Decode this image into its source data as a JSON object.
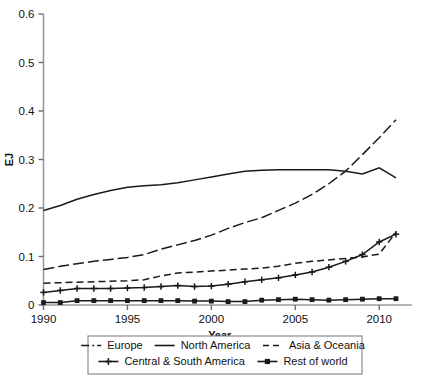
{
  "chart_data": {
    "type": "line",
    "title": "",
    "xlabel": "Year",
    "ylabel": "EJ",
    "xlim": [
      1990,
      2011
    ],
    "ylim": [
      0,
      0.6
    ],
    "xticks": [
      1990,
      1995,
      2000,
      2005,
      2010
    ],
    "yticks": [
      0,
      0.1,
      0.2,
      0.3,
      0.4,
      0.5,
      0.6
    ],
    "ytick_labels": [
      "0",
      "0.1",
      "0.2",
      "0.3",
      "0.4",
      "0.5",
      "0.6"
    ],
    "xtick_labels": [
      "1990",
      "1995",
      "2000",
      "2005",
      "2010"
    ],
    "grid": false,
    "legend_position": "below",
    "x": [
      1990,
      1991,
      1992,
      1993,
      1994,
      1995,
      1996,
      1997,
      1998,
      1999,
      2000,
      2001,
      2002,
      2003,
      2004,
      2005,
      2006,
      2007,
      2008,
      2009,
      2010,
      2011
    ],
    "series": [
      {
        "name": "Europe",
        "style": "dash-dot",
        "marker": "none",
        "color": "#1a1a1a",
        "values": [
          0.073,
          0.08,
          0.085,
          0.09,
          0.094,
          0.098,
          0.104,
          0.115,
          0.124,
          0.133,
          0.144,
          0.158,
          0.17,
          0.18,
          0.195,
          0.21,
          0.228,
          0.25,
          0.276,
          0.31,
          0.345,
          0.382
        ]
      },
      {
        "name": "North America",
        "style": "solid",
        "marker": "none",
        "color": "#1a1a1a",
        "values": [
          0.195,
          0.205,
          0.218,
          0.228,
          0.236,
          0.243,
          0.246,
          0.248,
          0.252,
          0.258,
          0.264,
          0.27,
          0.276,
          0.278,
          0.279,
          0.279,
          0.279,
          0.279,
          0.276,
          0.27,
          0.283,
          0.262
        ]
      },
      {
        "name": "Asia & Oceania",
        "style": "dashed",
        "marker": "none",
        "color": "#1a1a1a",
        "values": [
          0.045,
          0.046,
          0.047,
          0.048,
          0.049,
          0.05,
          0.052,
          0.06,
          0.066,
          0.068,
          0.07,
          0.072,
          0.074,
          0.076,
          0.08,
          0.086,
          0.09,
          0.093,
          0.096,
          0.099,
          0.105,
          0.15
        ]
      },
      {
        "name": "Central & South America",
        "style": "solid",
        "marker": "cross",
        "color": "#1a1a1a",
        "values": [
          0.026,
          0.03,
          0.034,
          0.034,
          0.034,
          0.035,
          0.036,
          0.038,
          0.04,
          0.038,
          0.039,
          0.043,
          0.048,
          0.052,
          0.056,
          0.062,
          0.068,
          0.078,
          0.09,
          0.104,
          0.13,
          0.146
        ]
      },
      {
        "name": "Rest of world",
        "style": "solid",
        "marker": "square",
        "color": "#1a1a1a",
        "values": [
          0.005,
          0.005,
          0.009,
          0.009,
          0.009,
          0.009,
          0.009,
          0.009,
          0.009,
          0.008,
          0.008,
          0.007,
          0.007,
          0.01,
          0.011,
          0.012,
          0.011,
          0.01,
          0.011,
          0.012,
          0.013,
          0.013
        ]
      }
    ]
  },
  "legend": {
    "rows": [
      [
        {
          "label": "Europe",
          "style": "dash-dot",
          "marker": "none"
        },
        {
          "label": "North America",
          "style": "solid",
          "marker": "none"
        },
        {
          "label": "Asia & Oceania",
          "style": "dashed",
          "marker": "none"
        }
      ],
      [
        {
          "label": "Central & South America",
          "style": "solid",
          "marker": "cross"
        },
        {
          "label": "Rest of world",
          "style": "solid",
          "marker": "square"
        }
      ]
    ]
  }
}
